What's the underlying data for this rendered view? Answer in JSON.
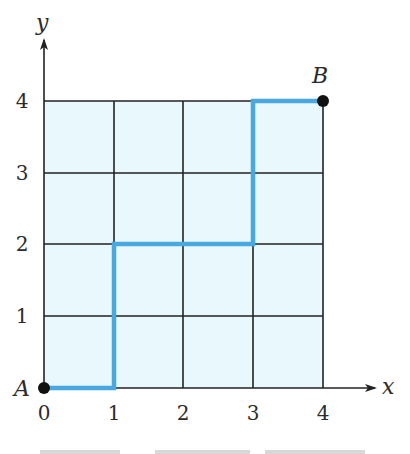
{
  "diagram": {
    "type": "lattice-path",
    "axes": {
      "x_label": "x",
      "y_label": "y",
      "x_ticks": [
        "0",
        "1",
        "2",
        "3",
        "4"
      ],
      "y_ticks": [
        "1",
        "2",
        "3",
        "4"
      ]
    },
    "points": [
      {
        "name": "A",
        "x": 0,
        "y": 0
      },
      {
        "name": "B",
        "x": 4,
        "y": 4
      }
    ],
    "path": [
      [
        0,
        0
      ],
      [
        1,
        0
      ],
      [
        1,
        2
      ],
      [
        3,
        2
      ],
      [
        3,
        4
      ],
      [
        4,
        4
      ]
    ],
    "grid": {
      "cols": 4,
      "rows": 4
    },
    "colors": {
      "grid_fill": "#e8f8fc",
      "grid_line": "#222222",
      "path": "#4aa8e0",
      "point": "#111111"
    }
  }
}
